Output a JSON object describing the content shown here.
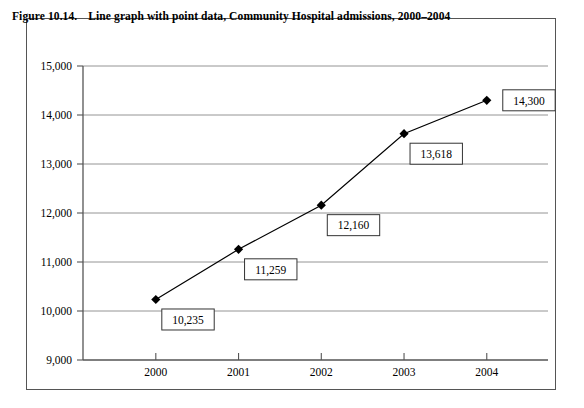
{
  "figure": {
    "number": "Figure 10.14.",
    "caption": "Line graph with point data, Community Hospital admissions, 2000–2004",
    "border_color": "#555555",
    "background": "#ffffff"
  },
  "chart_data": {
    "type": "line",
    "title": "Line graph with point data, Community Hospital admissions, 2000–2004",
    "xlabel": "",
    "ylabel": "",
    "categories": [
      "2000",
      "2001",
      "2002",
      "2003",
      "2004"
    ],
    "values": [
      10235,
      11259,
      12160,
      13618,
      14300
    ],
    "point_labels": [
      "10,235",
      "11,259",
      "12,160",
      "13,618",
      "14,300"
    ],
    "ylim": [
      9000,
      15000
    ],
    "ytick_values": [
      15000,
      14000,
      13000,
      12000,
      11000,
      10000,
      9000
    ],
    "ytick_labels": [
      "15,000",
      "14,000",
      "13,000",
      "12,000",
      "11,000",
      "10,000",
      "9,000"
    ],
    "xtick_labels": [
      "2000",
      "2001",
      "2002",
      "2003",
      "2004"
    ],
    "grid": true,
    "grid_axis": "y",
    "legend": false,
    "legend_position": "none",
    "marker": "diamond",
    "marker_color": "#000000",
    "line_color": "#000000",
    "grid_color": "#888888",
    "axis_color": "#555555"
  }
}
